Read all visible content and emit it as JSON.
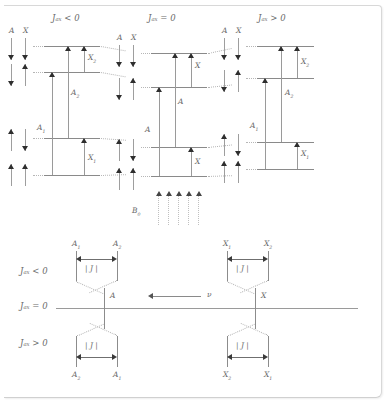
{
  "figure": {
    "type": "nmr-energy-level-diagram",
    "colors": {
      "line": "#8a8a8a",
      "arrow": "#2e2e2e",
      "text": "#6a6a6a",
      "dotted": "#b8b8b8",
      "background": "#ffffff"
    }
  },
  "panels": {
    "headers": {
      "negative": "Jₐₓ < 0",
      "zero": "Jₐₓ = 0",
      "positive": "Jₐₓ > 0"
    },
    "spin_column_header": {
      "a": "A",
      "x": "X"
    },
    "spin_states": [
      {
        "a": "down",
        "x": "down"
      },
      {
        "a": "down",
        "x": "up"
      },
      {
        "a": "up",
        "x": "down"
      },
      {
        "a": "up",
        "x": "up"
      }
    ],
    "negative": {
      "header": "Jₐₓ < 0",
      "transitions": [
        {
          "label": "X",
          "sub": "2"
        },
        {
          "label": "A",
          "sub": "2"
        },
        {
          "label": "A",
          "sub": "1"
        },
        {
          "label": "X",
          "sub": "1"
        }
      ]
    },
    "zero": {
      "header": "Jₐₓ = 0",
      "transitions": [
        {
          "label": "X",
          "sub": ""
        },
        {
          "label": "A",
          "sub": ""
        },
        {
          "label": "A",
          "sub": ""
        },
        {
          "label": "X",
          "sub": ""
        }
      ]
    },
    "positive": {
      "header": "Jₐₓ > 0",
      "transitions": [
        {
          "label": "X",
          "sub": "2"
        },
        {
          "label": "A",
          "sub": "2"
        },
        {
          "label": "A",
          "sub": "1"
        },
        {
          "label": "X",
          "sub": "1"
        }
      ]
    }
  },
  "field": {
    "label": "B",
    "sub": "0",
    "arrow_count": 5
  },
  "spectrum": {
    "row_labels": {
      "negative": "Jₐₓ < 0",
      "zero": "Jₐₓ = 0",
      "positive": "Jₐₓ > 0"
    },
    "frequency_axis": {
      "label": "ν",
      "direction": "left"
    },
    "coupling_label": "| J |",
    "a_group": {
      "center_label": "A",
      "top": {
        "left": {
          "label": "A",
          "sub": "1"
        },
        "right": {
          "label": "A",
          "sub": "2"
        }
      },
      "bottom": {
        "left": {
          "label": "A",
          "sub": "2"
        },
        "right": {
          "label": "A",
          "sub": "1"
        }
      }
    },
    "x_group": {
      "center_label": "X",
      "top": {
        "left": {
          "label": "X",
          "sub": "1"
        },
        "right": {
          "label": "X",
          "sub": "2"
        }
      },
      "bottom": {
        "left": {
          "label": "X",
          "sub": "2"
        },
        "right": {
          "label": "X",
          "sub": "1"
        }
      }
    }
  }
}
